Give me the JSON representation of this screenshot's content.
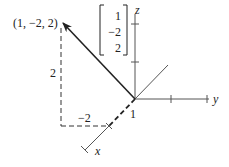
{
  "diagram": {
    "point_label": "(1, −2, 2)",
    "vector_entries": [
      "1",
      "−2",
      "2"
    ],
    "axes": {
      "x": "x",
      "y": "y",
      "z": "z"
    },
    "component_labels": {
      "z_height": "2",
      "y_offset": "−2",
      "x_offset": "1"
    },
    "colors": {
      "ink": "#222222",
      "axis": "#555555",
      "background": "#ffffff"
    }
  }
}
